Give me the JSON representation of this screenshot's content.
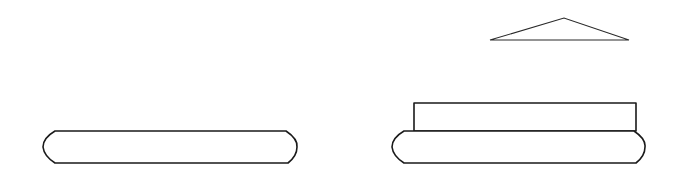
{
  "diagram": {
    "stroke_color": "#1a1a1a",
    "background": "#ffffff",
    "shapes": [
      {
        "id": "left-base-slab",
        "type": "rounded-slab",
        "x": 42,
        "y": 131,
        "width": 256,
        "height": 32
      },
      {
        "id": "right-base-slab",
        "type": "rounded-slab",
        "x": 392,
        "y": 131,
        "width": 251,
        "height": 32
      },
      {
        "id": "right-block",
        "type": "rectangle",
        "x": 414,
        "y": 103,
        "width": 222,
        "height": 28
      },
      {
        "id": "triangle-cap",
        "type": "triangle",
        "points": [
          [
            490,
            40
          ],
          [
            564,
            18
          ],
          [
            629,
            40
          ]
        ]
      }
    ]
  }
}
